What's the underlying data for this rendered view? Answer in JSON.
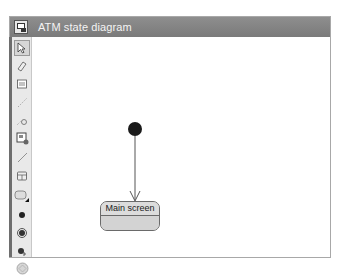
{
  "window": {
    "title": "ATM state diagram",
    "title_icon": "diagram-icon",
    "colors": {
      "titlebar": "#858585",
      "title_text": "#f4f4f4",
      "toolbar": "#e9e9e9",
      "canvas": "#ffffff",
      "state_fill": "#d8d8d8",
      "initial_node": "#1a1a1a"
    }
  },
  "toolbar": {
    "tools": [
      {
        "name": "select-tool",
        "icon": "pointer-icon",
        "selected": true
      },
      {
        "name": "note-tool",
        "icon": "eraser-icon",
        "selected": false
      },
      {
        "name": "text-tool",
        "icon": "document-icon",
        "selected": false
      },
      {
        "name": "anchor-tool",
        "icon": "dashed-line-icon",
        "selected": false
      },
      {
        "name": "constraint-tool",
        "icon": "constraint-icon",
        "selected": false
      },
      {
        "name": "region-tool",
        "icon": "picture-icon",
        "selected": false
      },
      {
        "name": "transition-tool",
        "icon": "line-icon",
        "selected": false
      },
      {
        "name": "composite-state-tool",
        "icon": "composite-state-icon",
        "selected": false
      },
      {
        "name": "state-tool",
        "icon": "state-icon",
        "selected": false
      },
      {
        "name": "initial-state-tool",
        "icon": "initial-node-icon",
        "selected": false
      },
      {
        "name": "final-state-tool",
        "icon": "final-node-icon",
        "selected": false
      },
      {
        "name": "history-tool",
        "icon": "history-icon",
        "selected": false
      },
      {
        "name": "choice-tool",
        "icon": "choice-icon",
        "selected": false
      },
      {
        "name": "junction-tool",
        "icon": "junction-icon",
        "selected": false
      }
    ]
  },
  "diagram": {
    "initial_node": {
      "label": ""
    },
    "states": [
      {
        "name": "Main screen"
      }
    ],
    "transitions": [
      {
        "from": "initial",
        "to": "Main screen"
      }
    ]
  }
}
